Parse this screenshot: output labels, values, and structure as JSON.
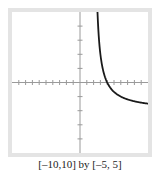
{
  "chart_data": {
    "type": "line",
    "title": "",
    "caption": "[–10,10] by [–5, 5]",
    "xlabel": "",
    "ylabel": "",
    "xlim": [
      -10,
      10
    ],
    "ylim": [
      -5,
      5
    ],
    "x_tick_step": 1,
    "y_tick_step": 1,
    "grid": false,
    "series": [
      {
        "name": "f(x)",
        "description": "Decreasing branch of a hyperbola with vertical asymptote near x=2, crossing x-axis near x=4, approaching about -1.6 at x=10",
        "x": [
          2.57,
          3,
          3.5,
          4,
          5,
          6,
          7,
          8,
          9,
          10
        ],
        "values": [
          5,
          2,
          0.67,
          0,
          -0.67,
          -1,
          -1.2,
          -1.33,
          -1.43,
          -1.5
        ]
      }
    ],
    "colors": {
      "curve": "#1a1a1a",
      "axes": "#9a9a9a",
      "frame": "#e4e4e4"
    }
  }
}
